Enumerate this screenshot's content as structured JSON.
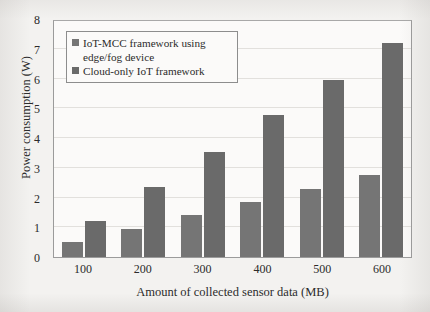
{
  "chart_data": {
    "type": "bar",
    "title": "",
    "xlabel": "Amount of collected sensor data (MB)",
    "ylabel": "Power consumption (W)",
    "categories": [
      "100",
      "200",
      "300",
      "400",
      "500",
      "600"
    ],
    "series": [
      {
        "name": "IoT-MCC framework using edge/fog device",
        "color": "#757575",
        "values": [
          0.5,
          0.95,
          1.4,
          1.85,
          2.3,
          2.75
        ]
      },
      {
        "name": "Cloud-only IoT framework",
        "color": "#6a6a6a",
        "values": [
          1.2,
          2.35,
          3.52,
          4.78,
          5.95,
          7.2
        ]
      }
    ],
    "ylim": [
      0,
      8
    ],
    "yticks": [
      0,
      1,
      2,
      3,
      4,
      5,
      6,
      7,
      8
    ],
    "ytick_labels": [
      "0",
      "1",
      "2",
      "3",
      "4",
      "5",
      "6",
      "7",
      "8"
    ],
    "grid": true,
    "grid_axis": "y",
    "legend_position": "upper-left-inside"
  },
  "legend": {
    "entries": [
      {
        "label": "IoT-MCC framework using edge/fog device"
      },
      {
        "label": "Cloud-only IoT framework"
      }
    ]
  }
}
